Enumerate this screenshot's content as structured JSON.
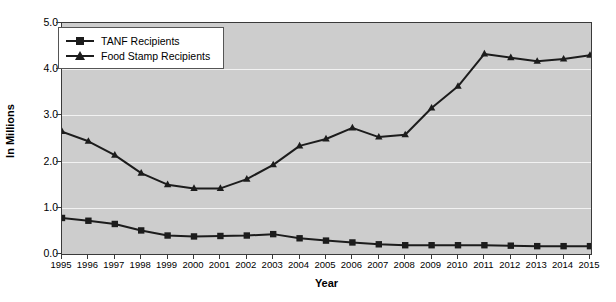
{
  "chart_data": {
    "type": "line",
    "title": "",
    "xlabel": "Year",
    "ylabel": "In Millions",
    "grid": true,
    "legend_position": "top-left",
    "xlim": [
      1995,
      2015
    ],
    "ylim": [
      0.0,
      5.0
    ],
    "ytick_labels": [
      "0.0",
      "1.0",
      "2.0",
      "3.0",
      "4.0",
      "5.0"
    ],
    "ytick_values": [
      0.0,
      1.0,
      2.0,
      3.0,
      4.0,
      5.0
    ],
    "categories": [
      "1995",
      "1996",
      "1997",
      "1998",
      "1999",
      "2000",
      "2001",
      "2002",
      "2003",
      "2004",
      "2005",
      "2006",
      "2007",
      "2008",
      "2009",
      "2010",
      "2011",
      "2012",
      "2013",
      "2014",
      "2015"
    ],
    "series": [
      {
        "name": "TANF Recipients",
        "marker": "square",
        "color": "#1c1c1c",
        "values": [
          0.78,
          0.72,
          0.65,
          0.51,
          0.4,
          0.38,
          0.39,
          0.4,
          0.43,
          0.34,
          0.29,
          0.25,
          0.21,
          0.19,
          0.19,
          0.19,
          0.19,
          0.18,
          0.17,
          0.17,
          0.17
        ]
      },
      {
        "name": "Food Stamp Recipients",
        "marker": "triangle",
        "color": "#1c1c1c",
        "values": [
          2.65,
          2.44,
          2.14,
          1.75,
          1.5,
          1.42,
          1.42,
          1.62,
          1.93,
          2.34,
          2.49,
          2.73,
          2.53,
          2.58,
          3.16,
          3.63,
          4.33,
          4.25,
          4.17,
          4.22,
          4.3
        ]
      }
    ]
  },
  "legend": {
    "items": [
      {
        "label": "TANF Recipients",
        "marker": "square"
      },
      {
        "label": "Food Stamp Recipients",
        "marker": "triangle"
      }
    ]
  },
  "colors": {
    "plot_background": "#cdcdcd",
    "gridline": "#f2f2f2",
    "series_line": "#1c1c1c",
    "axis": "#3a3a3a",
    "page_background": "#ffffff"
  }
}
